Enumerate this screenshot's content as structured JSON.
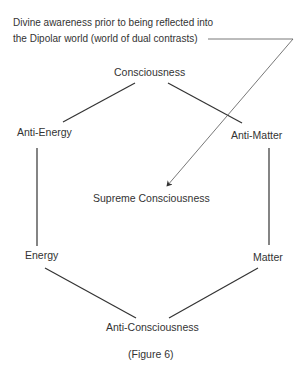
{
  "annotation": {
    "line1": "Divine awareness prior to being reflected into",
    "line2": "the Dipolar world (world of dual contrasts)"
  },
  "nodes": {
    "top": "Consciousness",
    "upper_left": "Anti-Energy",
    "upper_right": "Anti-Matter",
    "center": "Supreme Consciousness",
    "lower_left": "Energy",
    "lower_right": "Matter",
    "bottom": "Anti-Consciousness"
  },
  "caption": "(Figure 6)",
  "colors": {
    "line": "#333333",
    "leader": "#555555",
    "text": "#333333"
  }
}
